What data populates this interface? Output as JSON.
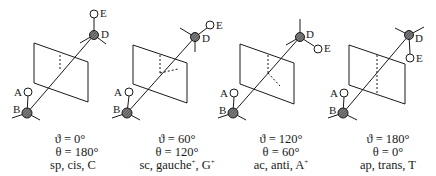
{
  "figure": {
    "panels": [
      {
        "id": "sp",
        "atom_labels": {
          "A": "A",
          "B": "B",
          "D": "D",
          "E": "E"
        },
        "caption": {
          "vartheta": "ϑ = 0°",
          "theta": "θ = 180°",
          "names": "sp, cis, C",
          "superscript": ""
        }
      },
      {
        "id": "sc",
        "atom_labels": {
          "A": "A",
          "B": "B",
          "D": "D",
          "E": "E"
        },
        "caption": {
          "vartheta": "ϑ = 60°",
          "theta": "θ = 120°",
          "names": "sc, gauche",
          "superscript": "+",
          "names_tail": ", G",
          "superscript2": "+"
        }
      },
      {
        "id": "ac",
        "atom_labels": {
          "A": "A",
          "B": "B",
          "D": "D",
          "E": "E"
        },
        "caption": {
          "vartheta": "ϑ = 120°",
          "theta": "θ = 60°",
          "names": "ac, anti, A",
          "superscript": "+"
        }
      },
      {
        "id": "ap",
        "atom_labels": {
          "A": "A",
          "B": "B",
          "D": "D",
          "E": "E"
        },
        "caption": {
          "vartheta": "ϑ = 180°",
          "theta": "θ = 0°",
          "names": "ap, trans, T",
          "superscript": ""
        }
      }
    ],
    "colors": {
      "line": "#1a1a1a",
      "atom_fill": "#555555",
      "background": "#ffffff"
    }
  }
}
